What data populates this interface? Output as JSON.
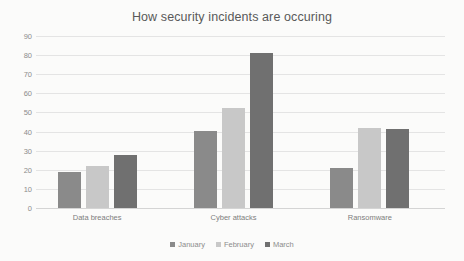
{
  "chart_data": {
    "type": "bar",
    "title": "How security incidents are occuring",
    "xlabel": "",
    "ylabel": "",
    "ylim": [
      0,
      90
    ],
    "ytick_step": 10,
    "yticks": [
      90,
      80,
      70,
      60,
      50,
      40,
      30,
      20,
      10,
      0
    ],
    "grid": true,
    "legend_position": "bottom",
    "categories": [
      "Data breaches",
      "Cyber attacks",
      "Ransomware"
    ],
    "series": [
      {
        "name": "January",
        "color": "#8a8a8a",
        "values": [
          19,
          40.5,
          21
        ]
      },
      {
        "name": "February",
        "color": "#c8c8c8",
        "values": [
          22,
          52.5,
          42
        ]
      },
      {
        "name": "March",
        "color": "#707070",
        "values": [
          28,
          81,
          41.5
        ]
      }
    ]
  }
}
